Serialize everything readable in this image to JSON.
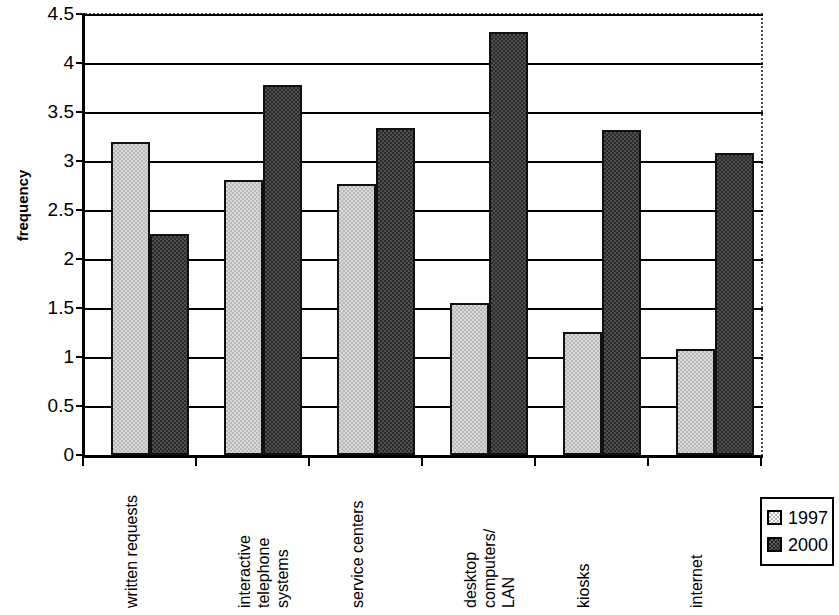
{
  "chart_data": {
    "type": "bar",
    "title": "",
    "xlabel": "",
    "ylabel": "frequency",
    "ylim": [
      0,
      4.5
    ],
    "yticks": [
      "0",
      "0.5",
      "1",
      "1.5",
      "2",
      "2.5",
      "3",
      "3.5",
      "4",
      "4.5"
    ],
    "ytick_values": [
      0,
      0.5,
      1,
      1.5,
      2,
      2.5,
      3,
      3.5,
      4,
      4.5
    ],
    "grid": "horizontal",
    "legend_position": "right-bottom",
    "categories": [
      "written requests",
      "interactive\ntelephone\nsystems",
      "service centers",
      "desktop\ncomputers/\nLAN",
      "kiosks",
      "internet"
    ],
    "series": [
      {
        "name": "1997",
        "color": "#c0c0c0",
        "values": [
          3.19,
          2.81,
          2.77,
          1.55,
          1.26,
          1.08
        ]
      },
      {
        "name": "2000",
        "color": "#2b2b2b",
        "values": [
          2.26,
          3.78,
          3.34,
          4.32,
          3.32,
          3.08
        ]
      }
    ]
  },
  "legend": {
    "entries": [
      {
        "label": "1997",
        "swatch": "light-checker-swatch"
      },
      {
        "label": "2000",
        "swatch": "dark-checker-swatch"
      }
    ]
  }
}
